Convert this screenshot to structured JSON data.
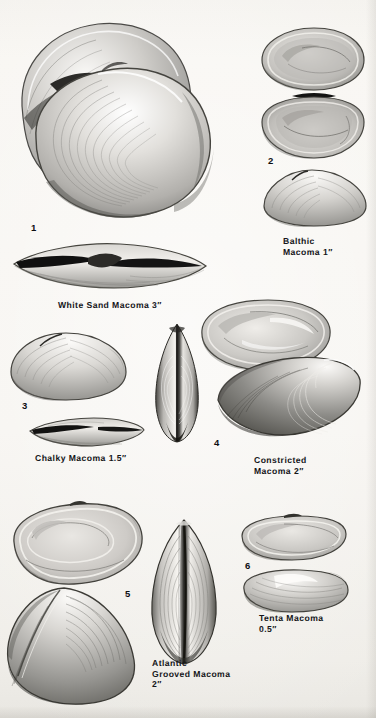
{
  "plate": {
    "title": "Macoma Clams Identification Plate",
    "background_color": "#f5f3ef",
    "ink_color": "#15161a",
    "width": 376,
    "height": 718
  },
  "figures": [
    {
      "number": "1",
      "common_name": "White Sand Macoma",
      "size": "3″",
      "caption": "White Sand Macoma 3″",
      "views": [
        "exterior valve pair",
        "hinge/dorsal view"
      ]
    },
    {
      "number": "2",
      "common_name": "Balthic Macoma",
      "size": "1″",
      "caption": "Balthic\nMacoma 1″",
      "views": [
        "interior upper valve",
        "interior lower valve",
        "exterior valve"
      ]
    },
    {
      "number": "3",
      "common_name": "Chalky Macoma",
      "size": "1.5″",
      "caption": "Chalky Macoma 1.5″",
      "views": [
        "exterior valve",
        "dorsal hinge view"
      ]
    },
    {
      "number": "4",
      "common_name": "Constricted Macoma",
      "size": "2″",
      "caption": "Constricted\nMacoma 2″",
      "views": [
        "interior valve",
        "exterior valve",
        "anterior end view"
      ]
    },
    {
      "number": "5",
      "common_name": "Atlantic Grooved Macoma",
      "size": "2″",
      "caption": "Atlantic\nGrooved Macoma\n2″",
      "views": [
        "interior valve",
        "exterior valve",
        "ventral grooved view"
      ]
    },
    {
      "number": "6",
      "common_name": "Tenta Macoma",
      "size": "0.5″",
      "caption": "Tenta Macoma\n0.5″",
      "views": [
        "interior valve",
        "exterior valve"
      ]
    }
  ],
  "labels": {
    "fig1_number": "1",
    "fig2_number": "2",
    "fig3_number": "3",
    "fig4_number": "4",
    "fig5_number": "5",
    "fig6_number": "6",
    "cap_white_sand": "White Sand Macoma 3″",
    "cap_balthic": "Balthic\nMacoma 1″",
    "cap_chalky": "Chalky Macoma 1.5″",
    "cap_constricted": "Constricted\nMacoma 2″",
    "cap_atlantic": "Atlantic\nGrooved Macoma\n2″",
    "cap_tenta": "Tenta Macoma\n0.5″"
  }
}
